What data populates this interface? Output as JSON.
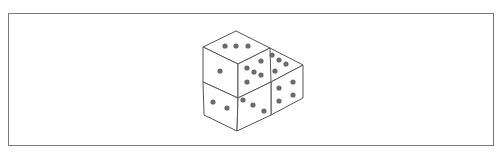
{
  "figure": {
    "line_color": "#555555",
    "dot_color": "#6b6b6b",
    "frame_color": "#7a7a7a"
  },
  "dice": [
    {
      "name": "top-left-die",
      "faces": {
        "top": 3,
        "left": 1,
        "right": 5
      }
    },
    {
      "name": "bottom-left-die",
      "faces": {
        "left": 2,
        "right": 3
      }
    },
    {
      "name": "right-die",
      "faces": {
        "top": 3,
        "right": 4
      }
    }
  ]
}
